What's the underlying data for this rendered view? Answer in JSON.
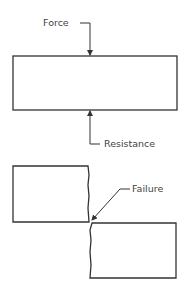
{
  "diagram": {
    "labels": {
      "force": "Force",
      "resistance": "Resistance",
      "failure": "Failure"
    },
    "colors": {
      "stroke": "#333333",
      "text": "#444444",
      "background": "#ffffff"
    },
    "elements": {
      "intact_block": {
        "x": 13,
        "y": 56,
        "width": 164,
        "height": 54
      },
      "fractured_left_block": {
        "x": 13,
        "y": 166,
        "width": 76,
        "height": 56
      },
      "fractured_right_block": {
        "x": 90,
        "y": 223,
        "width": 86,
        "height": 55
      }
    }
  }
}
